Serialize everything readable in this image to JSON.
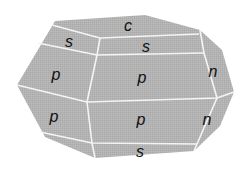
{
  "diagram": {
    "type": "crystal-habit",
    "colors": {
      "face_fill": "#b3b3b3",
      "edge_stroke": "#f4f4f4",
      "label": "#111111",
      "background": "#ffffff"
    },
    "outline": "55,21 145,15 200,30 222,50 234,92 220,126 194,151 95,158 45,137 17,85",
    "edges": [
      {
        "name": "edge-c-s-left",
        "points": "52,25 100,38 199,34"
      },
      {
        "name": "edge-s-p-top",
        "points": "38,43 97,55 204,53"
      },
      {
        "name": "edge-p-p-middle",
        "points": "17,85 87,102 217,98 234,92"
      },
      {
        "name": "edge-p-s-bottom",
        "points": "40,132 92,143 197,144"
      },
      {
        "name": "edge-vertical-left",
        "points": "100,38 97,55 87,102 92,143 95,158"
      },
      {
        "name": "edge-vertical-right-upper",
        "points": "200,30 204,53 217,98"
      },
      {
        "name": "edge-vertical-right-lower",
        "points": "217,98 197,144 194,151"
      }
    ],
    "labels": [
      {
        "name": "face-label-c",
        "text": "c",
        "x": 128,
        "y": 31
      },
      {
        "name": "face-label-s-upper-left",
        "text": "s",
        "x": 69,
        "y": 47
      },
      {
        "name": "face-label-s-upper-middle",
        "text": "s",
        "x": 146,
        "y": 52
      },
      {
        "name": "face-label-p-upper-left",
        "text": "p",
        "x": 56,
        "y": 80
      },
      {
        "name": "face-label-p-upper-middle",
        "text": "p",
        "x": 142,
        "y": 83
      },
      {
        "name": "face-label-n-upper",
        "text": "n",
        "x": 213,
        "y": 77
      },
      {
        "name": "face-label-p-lower-left",
        "text": "p",
        "x": 54,
        "y": 122
      },
      {
        "name": "face-label-p-lower-middle",
        "text": "p",
        "x": 141,
        "y": 125
      },
      {
        "name": "face-label-n-lower",
        "text": "n",
        "x": 207,
        "y": 125
      },
      {
        "name": "face-label-s-bottom",
        "text": "s",
        "x": 140,
        "y": 157
      }
    ]
  }
}
